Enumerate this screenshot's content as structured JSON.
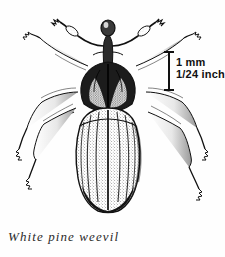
{
  "figure": {
    "caption": "White pine weevil",
    "background_color": "#fefefe",
    "ink_color": "#111111"
  },
  "scale_bar": {
    "primary_label": "1  mm",
    "secondary_label": "1/24  inch",
    "orientation": "vertical",
    "bar_height_px": 38
  }
}
